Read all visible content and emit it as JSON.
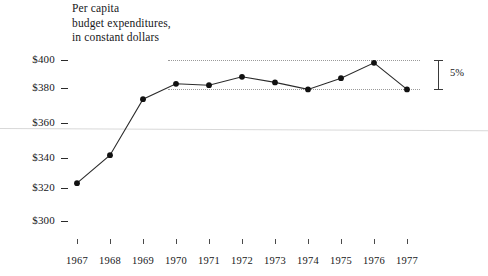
{
  "chart_data": {
    "type": "line",
    "title": "Per capita budget expenditures, in constant dollars",
    "title_lines": [
      "Per capita",
      "budget expenditures,",
      "in constant dollars"
    ],
    "xlabel": "",
    "ylabel": "",
    "categories": [
      "1967",
      "1968",
      "1969",
      "1970",
      "1971",
      "1972",
      "1973",
      "1974",
      "1975",
      "1976",
      "1977"
    ],
    "values": [
      312,
      332,
      372,
      383,
      382,
      388,
      384,
      379,
      387,
      398,
      379
    ],
    "series": [
      {
        "name": "Per capita budget expenditures",
        "values": [
          312,
          332,
          372,
          383,
          382,
          388,
          384,
          379,
          387,
          398,
          379
        ]
      }
    ],
    "ylim": [
      295,
      404
    ],
    "xlim": [
      "1967",
      "1977"
    ],
    "ytick_labels": [
      "$400",
      "$380",
      "$360",
      "$340",
      "$320",
      "$300"
    ],
    "ytick_values": [
      400,
      380,
      360,
      340,
      320,
      300
    ],
    "xtick_labels": [
      "1967",
      "1968",
      "1969",
      "1970",
      "1971",
      "1972",
      "1973",
      "1974",
      "1975",
      "1976",
      "1977"
    ],
    "grid": false,
    "legend": false,
    "annotations": [
      {
        "name": "range-bracket",
        "label": "5%",
        "from_value": 379,
        "to_value": 398,
        "description": "vertical bracket measuring the band between the two dotted reference lines"
      }
    ],
    "reference_lines": [
      {
        "name": "upper-reference-line",
        "value": 398,
        "style": "dotted",
        "from_category": "1970",
        "to_category": "1977"
      },
      {
        "name": "lower-reference-line",
        "value": 379,
        "style": "dotted",
        "from_category": "1970",
        "to_category": "1977"
      }
    ],
    "colors": {
      "line": "#2b2b2b",
      "marker": "#111111",
      "reference_line": "#9a9a9a",
      "axis": "#2b2b2b",
      "text": "#17171a",
      "background": "#ffffff"
    }
  }
}
